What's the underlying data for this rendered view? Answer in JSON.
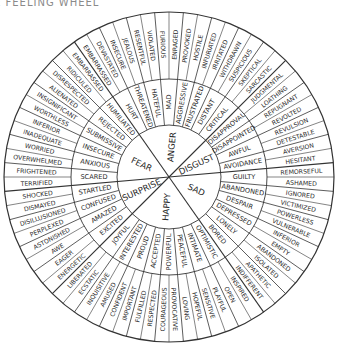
{
  "title": "E FEELING WHEEL",
  "wheel": {
    "center": [
      169,
      177
    ],
    "radii": {
      "inner": 52,
      "middle": 98,
      "outer": 165
    },
    "start_angle_deg": 125,
    "line_color": "#333333",
    "sectors": [
      {
        "core": "ANGER",
        "middle": [
          "HURT",
          "THREATENED",
          "HATEFUL",
          "MAD",
          "AGGRESSIVE",
          "FRUSTRATED",
          "DISTANT",
          "CRITICAL"
        ],
        "outer": [
          "EMBARRASSED",
          "DEVASTATED",
          "INSECURE",
          "JEALOUS",
          "RESENTFUL",
          "VIOLATED",
          "FURIOUS",
          "ENRAGED",
          "PROVOKED",
          "HOSTILE",
          "INFURIATED",
          "IRRITATED",
          "WITHDRAWN",
          "SUSPICIOUS",
          "SKEPTICAL",
          "SARCASTIC"
        ]
      },
      {
        "core": "DISGUST",
        "middle": [
          "DISAPPROVAL",
          "DISAPPOINTED",
          "AWFUL",
          "AVOIDANCE"
        ],
        "outer": [
          "JUDGMENTAL",
          "LOATHING",
          "REPUGNANT",
          "REVOLTED",
          "REVULSION",
          "DETESTABLE",
          "AVERSION",
          "HESITANT"
        ]
      },
      {
        "core": "SAD",
        "middle": [
          "GUILTY",
          "ABANDONED",
          "DESPAIR",
          "DEPRESSED",
          "LONELY",
          "BORED"
        ],
        "outer": [
          "REMORSEFUL",
          "ASHAMED",
          "IGNORED",
          "VICTIMIZED",
          "POWERLESS",
          "VULNERABLE",
          "INFERIOR",
          "EMPTY",
          "ABANDONED",
          "ISOLATED",
          "APATHETIC",
          "INDIFFERENT"
        ]
      },
      {
        "core": "HAPPY",
        "middle": [
          "OPTIMISTIC",
          "INTIMATE",
          "PEACEFUL",
          "POWERFUL",
          "ACCEPTED",
          "PROUD",
          "INTERESTED",
          "JOYFUL"
        ],
        "outer": [
          "INSPIRED",
          "OPEN",
          "PLAYFUL",
          "SENSITIVE",
          "HOPEFUL",
          "LOVING",
          "PROVOCATIVE",
          "COURAGEOUS",
          "RESPECTED",
          "FULFILLED",
          "IMPORTANT",
          "CONFIDENT",
          "AMUSED",
          "INQUISITIVE",
          "ECSTATIC",
          "LIBERATED"
        ]
      },
      {
        "core": "SURPRISE",
        "middle": [
          "EXCITED",
          "AMAZED",
          "CONFUSED",
          "STARTLED"
        ],
        "outer": [
          "ENERGETIC",
          "EAGER",
          "AWE",
          "ASTONISHED",
          "PERPLEXED",
          "DISILLUSIONED",
          "DISMAYED",
          "SHOCKED"
        ]
      },
      {
        "core": "FEAR",
        "middle": [
          "SCARED",
          "ANXIOUS",
          "INSECURE",
          "SUBMISSIVE",
          "REJECTED",
          "HUMILIATED"
        ],
        "outer": [
          "TERRIFIED",
          "FRIGHTENED",
          "OVERWHELMED",
          "WORRIED",
          "INADEQUATE",
          "INFERIOR",
          "WORTHLESS",
          "INSIGNIFICANT",
          "ALIENATED",
          "DISRESPECTED",
          "RIDICULED",
          "EMBARRASSED"
        ]
      }
    ]
  }
}
